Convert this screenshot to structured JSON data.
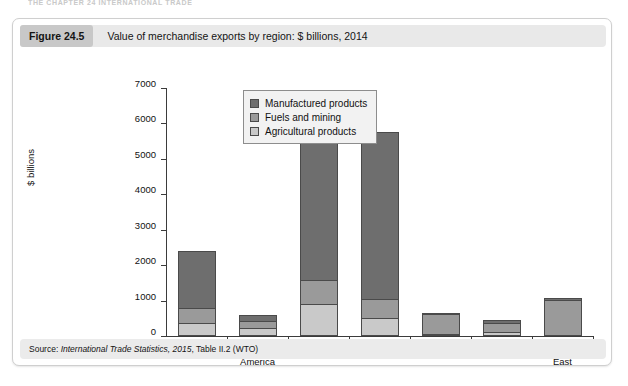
{
  "page": {
    "running_head": "THE CHAPTER 24 INTERNATIONAL TRADE"
  },
  "figure": {
    "number_label": "Figure 24.5",
    "caption": "Value of merchandise exports by region: $ billions, 2014",
    "source_prefix": "Source: ",
    "source_italic": "International Trade Statistics, 2015",
    "source_suffix": ", Table II.2 (WTO)"
  },
  "colors": {
    "manufactured": "#6e6e6e",
    "fuels": "#9a9a9a",
    "agricultural": "#c9c9c9",
    "outline": "#4a4a4a",
    "header_band": "#e9e9e9",
    "number_chip": "#c8c8c8",
    "legend_bg": "#f2f2f2",
    "axis": "#3b3b3b"
  },
  "chart_data": {
    "type": "bar",
    "title": "Value of merchandise exports by region: $ billions, 2014",
    "xlabel": "",
    "ylabel": "$ billions",
    "ylim": [
      0,
      7000
    ],
    "yticks": [
      0,
      1000,
      2000,
      3000,
      4000,
      5000,
      6000,
      7000
    ],
    "ytick_labels": [
      "0",
      "1000",
      "2000",
      "3000",
      "4000",
      "5000",
      "6000",
      "7000"
    ],
    "grid": false,
    "stacked": true,
    "legend_position": "upper-center",
    "categories": [
      "N America",
      "S & C America",
      "Europe",
      "Asia",
      "CIS",
      "Africa",
      "Middle East"
    ],
    "category_label_lines": [
      [
        "N America"
      ],
      [
        "S & C",
        "America"
      ],
      [
        "Europe"
      ],
      [
        "Asia"
      ],
      [
        "CIS"
      ],
      [
        "Africa"
      ],
      [
        "Middle",
        "East"
      ]
    ],
    "series": [
      {
        "name": "Agricultural products",
        "color": "#c9c9c9",
        "values": [
          370,
          220,
          900,
          510,
          60,
          110,
          40
        ]
      },
      {
        "name": "Fuels and mining",
        "color": "#9a9a9a",
        "values": [
          420,
          200,
          680,
          540,
          570,
          250,
          980
        ]
      },
      {
        "name": "Manufactured products",
        "color": "#6e6e6e",
        "values": [
          1610,
          180,
          4970,
          4700,
          30,
          90,
          50
        ]
      }
    ],
    "totals": [
      2400,
      600,
      6550,
      5750,
      660,
      450,
      1070
    ],
    "legend_entries": [
      "Manufactured products",
      "Fuels and mining",
      "Agricultural products"
    ]
  }
}
